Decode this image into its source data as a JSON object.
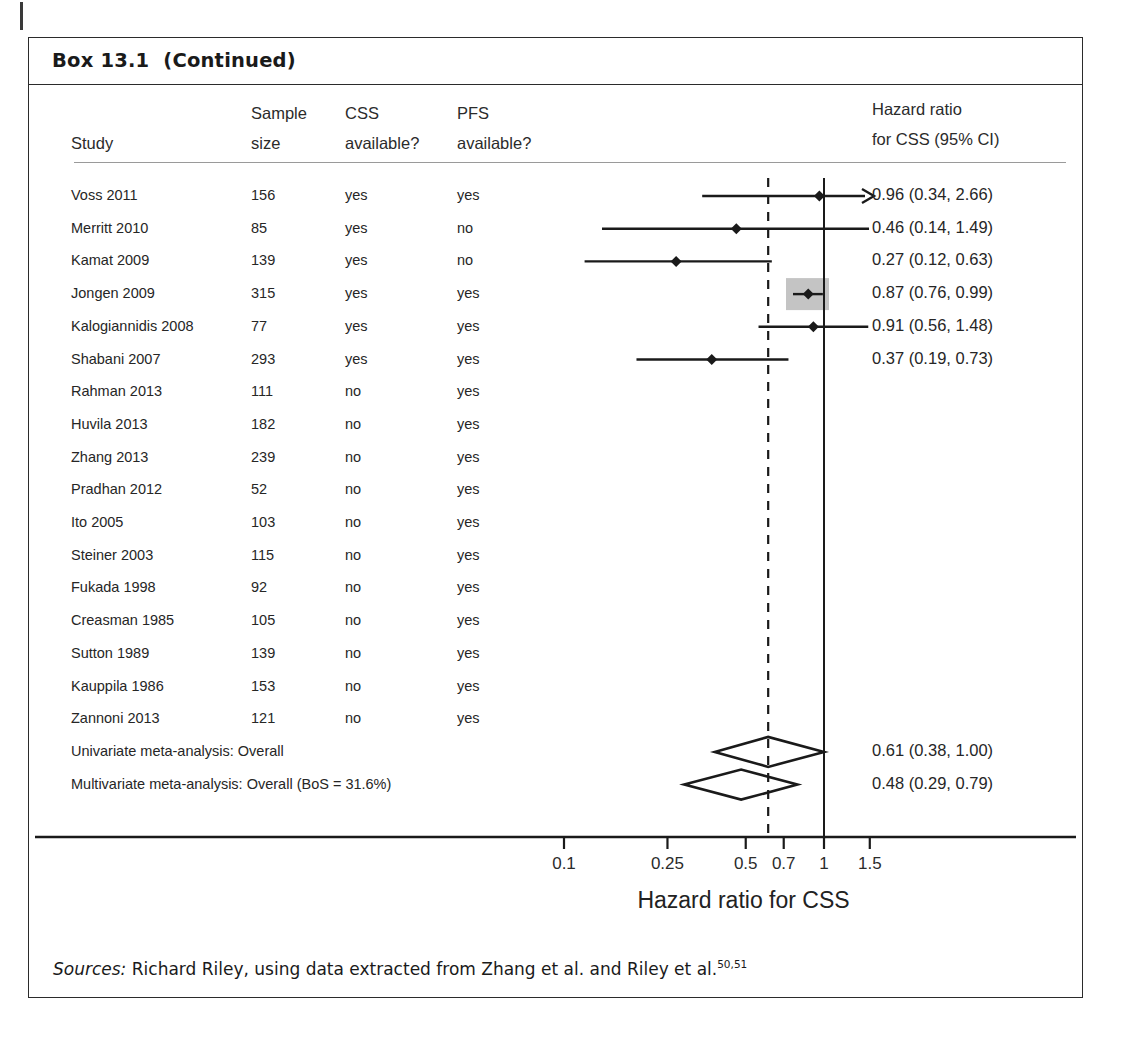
{
  "box": {
    "title": "Box 13.1  (Continued)"
  },
  "table": {
    "headers": {
      "study": "Study",
      "sample_size_l1": "Sample",
      "sample_size_l2": "size",
      "css_l1": "CSS",
      "css_l2": "available?",
      "pfs_l1": "PFS",
      "pfs_l2": "available?",
      "result_l1": "Hazard ratio",
      "result_l2": "for CSS (95% CI)"
    },
    "rows": [
      {
        "study": "Voss 2011",
        "n": "156",
        "css": "yes",
        "pfs": "yes",
        "result": "0.96 (0.34, 2.66)",
        "hr": 0.96,
        "lo": 0.34,
        "hi": 2.66,
        "clipped_right": true,
        "highlight": false
      },
      {
        "study": "Merritt 2010",
        "n": "85",
        "css": "yes",
        "pfs": "no",
        "result": "0.46 (0.14, 1.49)",
        "hr": 0.46,
        "lo": 0.14,
        "hi": 1.49,
        "clipped_right": false,
        "highlight": false
      },
      {
        "study": "Kamat 2009",
        "n": "139",
        "css": "yes",
        "pfs": "no",
        "result": "0.27 (0.12, 0.63)",
        "hr": 0.27,
        "lo": 0.12,
        "hi": 0.63,
        "clipped_right": false,
        "highlight": false
      },
      {
        "study": "Jongen 2009",
        "n": "315",
        "css": "yes",
        "pfs": "yes",
        "result": "0.87 (0.76, 0.99)",
        "hr": 0.87,
        "lo": 0.76,
        "hi": 0.99,
        "clipped_right": false,
        "highlight": true
      },
      {
        "study": "Kalogiannidis 2008",
        "n": "77",
        "css": "yes",
        "pfs": "yes",
        "result": "0.91 (0.56, 1.48)",
        "hr": 0.91,
        "lo": 0.56,
        "hi": 1.48,
        "clipped_right": false,
        "highlight": false
      },
      {
        "study": "Shabani 2007",
        "n": "293",
        "css": "yes",
        "pfs": "yes",
        "result": "0.37 (0.19, 0.73)",
        "hr": 0.37,
        "lo": 0.19,
        "hi": 0.73,
        "clipped_right": false,
        "highlight": false
      },
      {
        "study": "Rahman 2013",
        "n": "111",
        "css": "no",
        "pfs": "yes",
        "result": "",
        "hr": null,
        "lo": null,
        "hi": null,
        "clipped_right": false,
        "highlight": false
      },
      {
        "study": "Huvila 2013",
        "n": "182",
        "css": "no",
        "pfs": "yes",
        "result": "",
        "hr": null,
        "lo": null,
        "hi": null,
        "clipped_right": false,
        "highlight": false
      },
      {
        "study": "Zhang 2013",
        "n": "239",
        "css": "no",
        "pfs": "yes",
        "result": "",
        "hr": null,
        "lo": null,
        "hi": null,
        "clipped_right": false,
        "highlight": false
      },
      {
        "study": "Pradhan 2012",
        "n": "52",
        "css": "no",
        "pfs": "yes",
        "result": "",
        "hr": null,
        "lo": null,
        "hi": null,
        "clipped_right": false,
        "highlight": false
      },
      {
        "study": "Ito 2005",
        "n": "103",
        "css": "no",
        "pfs": "yes",
        "result": "",
        "hr": null,
        "lo": null,
        "hi": null,
        "clipped_right": false,
        "highlight": false
      },
      {
        "study": "Steiner 2003",
        "n": "115",
        "css": "no",
        "pfs": "yes",
        "result": "",
        "hr": null,
        "lo": null,
        "hi": null,
        "clipped_right": false,
        "highlight": false
      },
      {
        "study": "Fukada 1998",
        "n": "92",
        "css": "no",
        "pfs": "yes",
        "result": "",
        "hr": null,
        "lo": null,
        "hi": null,
        "clipped_right": false,
        "highlight": false
      },
      {
        "study": "Creasman 1985",
        "n": "105",
        "css": "no",
        "pfs": "yes",
        "result": "",
        "hr": null,
        "lo": null,
        "hi": null,
        "clipped_right": false,
        "highlight": false
      },
      {
        "study": "Sutton 1989",
        "n": "139",
        "css": "no",
        "pfs": "yes",
        "result": "",
        "hr": null,
        "lo": null,
        "hi": null,
        "clipped_right": false,
        "highlight": false
      },
      {
        "study": "Kauppila 1986",
        "n": "153",
        "css": "no",
        "pfs": "yes",
        "result": "",
        "hr": null,
        "lo": null,
        "hi": null,
        "clipped_right": false,
        "highlight": false
      },
      {
        "study": "Zannoni 2013",
        "n": "121",
        "css": "no",
        "pfs": "yes",
        "result": "",
        "hr": null,
        "lo": null,
        "hi": null,
        "clipped_right": false,
        "highlight": false
      }
    ],
    "summaries": [
      {
        "label": "Univariate meta-analysis: Overall",
        "result": "0.61 (0.38, 1.00)",
        "hr": 0.61,
        "lo": 0.38,
        "hi": 1.0
      },
      {
        "label": "Multivariate meta-analysis: Overall (BoS = 31.6%)",
        "result": "0.48 (0.29, 0.79)",
        "hr": 0.48,
        "lo": 0.29,
        "hi": 0.79
      }
    ]
  },
  "chart_data": {
    "type": "forest",
    "title": "Hazard ratio for CSS",
    "xlabel": "Hazard ratio for CSS",
    "ylabel": "",
    "xscale": "log",
    "xlim": [
      0.09,
      1.9
    ],
    "grid": false,
    "null_line": 1,
    "reference_line_dashed": 0.61,
    "tick_values": [
      0.1,
      0.25,
      0.5,
      0.7,
      1,
      1.5
    ],
    "tick_labels": [
      "0.1",
      "0.25",
      "0.5",
      "0.7",
      "1",
      "1.5"
    ],
    "legend": [],
    "annotations": [
      "arrow at right end of Voss 2011 interval indicates upper limit extends beyond plot"
    ],
    "studies": [
      {
        "name": "Voss 2011",
        "n": 156,
        "hr": 0.96,
        "ci_low": 0.34,
        "ci_high": 2.66
      },
      {
        "name": "Merritt 2010",
        "n": 85,
        "hr": 0.46,
        "ci_low": 0.14,
        "ci_high": 1.49
      },
      {
        "name": "Kamat 2009",
        "n": 139,
        "hr": 0.27,
        "ci_low": 0.12,
        "ci_high": 0.63
      },
      {
        "name": "Jongen 2009",
        "n": 315,
        "hr": 0.87,
        "ci_low": 0.76,
        "ci_high": 0.99
      },
      {
        "name": "Kalogiannidis 2008",
        "n": 77,
        "hr": 0.91,
        "ci_low": 0.56,
        "ci_high": 1.48
      },
      {
        "name": "Shabani 2007",
        "n": 293,
        "hr": 0.37,
        "ci_low": 0.19,
        "ci_high": 0.73
      },
      {
        "name": "Rahman 2013",
        "n": 111,
        "hr": null,
        "ci_low": null,
        "ci_high": null
      },
      {
        "name": "Huvila 2013",
        "n": 182,
        "hr": null,
        "ci_low": null,
        "ci_high": null
      },
      {
        "name": "Zhang 2013",
        "n": 239,
        "hr": null,
        "ci_low": null,
        "ci_high": null
      },
      {
        "name": "Pradhan 2012",
        "n": 52,
        "hr": null,
        "ci_low": null,
        "ci_high": null
      },
      {
        "name": "Ito 2005",
        "n": 103,
        "hr": null,
        "ci_low": null,
        "ci_high": null
      },
      {
        "name": "Steiner 2003",
        "n": 115,
        "hr": null,
        "ci_low": null,
        "ci_high": null
      },
      {
        "name": "Fukada 1998",
        "n": 92,
        "hr": null,
        "ci_low": null,
        "ci_high": null
      },
      {
        "name": "Creasman 1985",
        "n": 105,
        "hr": null,
        "ci_low": null,
        "ci_high": null
      },
      {
        "name": "Sutton 1989",
        "n": 139,
        "hr": null,
        "ci_low": null,
        "ci_high": null
      },
      {
        "name": "Kauppila 1986",
        "n": 153,
        "hr": null,
        "ci_low": null,
        "ci_high": null
      },
      {
        "name": "Zannoni 2013",
        "n": 121,
        "hr": null,
        "ci_low": null,
        "ci_high": null
      }
    ],
    "pooled": [
      {
        "name": "Univariate meta-analysis: Overall",
        "hr": 0.61,
        "ci_low": 0.38,
        "ci_high": 1.0
      },
      {
        "name": "Multivariate meta-analysis: Overall (BoS = 31.6%)",
        "hr": 0.48,
        "ci_low": 0.29,
        "ci_high": 0.79
      }
    ]
  },
  "sources": {
    "keyword": "Sources:",
    "text": " Richard Riley, using data extracted from Zhang et al. and Riley et al.",
    "refs": "50,51"
  },
  "colors": {
    "ink": "#1a1a1a",
    "rule": "#9a9a9a",
    "frame": "#2b2b2b",
    "highlight_box": "#c4c4c4"
  }
}
